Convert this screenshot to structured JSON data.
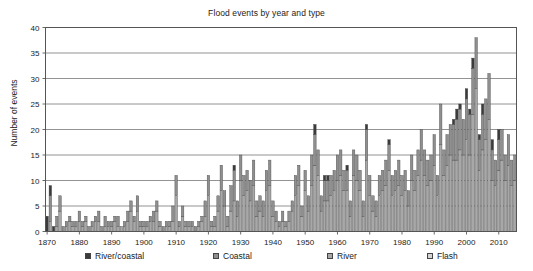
{
  "chart": {
    "title": "Flood events by year and type",
    "ylabel": "Number of events"
  },
  "legend": {
    "items": [
      {
        "label": "River/coastal",
        "color": "#3b3b3b",
        "x": 85
      },
      {
        "label": "Coastal",
        "color": "#8f8f8f",
        "x": 213
      },
      {
        "label": "River",
        "color": "#a8a8a8",
        "x": 327
      },
      {
        "label": "Flash",
        "color": "#d4d4d4",
        "x": 427
      }
    ]
  },
  "chart_data": {
    "type": "bar",
    "title": "Flood events by year and type",
    "xlabel": "",
    "ylabel": "Number of events",
    "ylim": [
      0,
      40
    ],
    "ytick_step": 5,
    "yticks": [
      0,
      5,
      10,
      15,
      20,
      25,
      30,
      35,
      40
    ],
    "xlim": [
      1870,
      2016
    ],
    "xticks": [
      1870,
      1880,
      1890,
      1900,
      1910,
      1920,
      1930,
      1940,
      1950,
      1960,
      1970,
      1980,
      1990,
      2000,
      2010
    ],
    "grid": true,
    "stacked": true,
    "legend_position": "bottom",
    "series": [
      {
        "name": "River/coastal",
        "color": "#3b3b3b"
      },
      {
        "name": "Coastal",
        "color": "#8f8f8f"
      },
      {
        "name": "River",
        "color": "#a8a8a8"
      },
      {
        "name": "Flash",
        "color": "#d4d4d4"
      }
    ],
    "categories": [
      1870,
      1871,
      1872,
      1873,
      1874,
      1875,
      1876,
      1877,
      1878,
      1879,
      1880,
      1881,
      1882,
      1883,
      1884,
      1885,
      1886,
      1887,
      1888,
      1889,
      1890,
      1891,
      1892,
      1893,
      1894,
      1895,
      1896,
      1897,
      1898,
      1899,
      1900,
      1901,
      1902,
      1903,
      1904,
      1905,
      1906,
      1907,
      1908,
      1909,
      1910,
      1911,
      1912,
      1913,
      1914,
      1915,
      1916,
      1917,
      1918,
      1919,
      1920,
      1921,
      1922,
      1923,
      1924,
      1925,
      1926,
      1927,
      1928,
      1929,
      1930,
      1931,
      1932,
      1933,
      1934,
      1935,
      1936,
      1937,
      1938,
      1939,
      1940,
      1941,
      1942,
      1943,
      1944,
      1945,
      1946,
      1947,
      1948,
      1949,
      1950,
      1951,
      1952,
      1953,
      1954,
      1955,
      1956,
      1957,
      1958,
      1959,
      1960,
      1961,
      1962,
      1963,
      1964,
      1965,
      1966,
      1967,
      1968,
      1969,
      1970,
      1971,
      1972,
      1973,
      1974,
      1975,
      1976,
      1977,
      1978,
      1979,
      1980,
      1981,
      1982,
      1983,
      1984,
      1985,
      1986,
      1987,
      1988,
      1989,
      1990,
      1991,
      1992,
      1993,
      1994,
      1995,
      1996,
      1997,
      1998,
      1999,
      2000,
      2001,
      2002,
      2003,
      2004,
      2005,
      2006,
      2007,
      2008,
      2009,
      2010,
      2011,
      2012,
      2013,
      2014,
      2015
    ],
    "stacks": [
      [
        3,
        0,
        0,
        0
      ],
      [
        2,
        5,
        2,
        0
      ],
      [
        1,
        0,
        0,
        0
      ],
      [
        0,
        2,
        1,
        0
      ],
      [
        0,
        3,
        4,
        0
      ],
      [
        0,
        1,
        0,
        0
      ],
      [
        0,
        1,
        1,
        0
      ],
      [
        0,
        1,
        2,
        0
      ],
      [
        0,
        1,
        1,
        0
      ],
      [
        0,
        1,
        1,
        0
      ],
      [
        0,
        2,
        2,
        0
      ],
      [
        0,
        1,
        1,
        0
      ],
      [
        0,
        1,
        2,
        0
      ],
      [
        0,
        1,
        0,
        0
      ],
      [
        0,
        1,
        1,
        0
      ],
      [
        0,
        1,
        2,
        0
      ],
      [
        0,
        2,
        2,
        0
      ],
      [
        0,
        1,
        0,
        0
      ],
      [
        0,
        2,
        1,
        0
      ],
      [
        0,
        1,
        1,
        0
      ],
      [
        0,
        1,
        1,
        0
      ],
      [
        0,
        1,
        2,
        0
      ],
      [
        0,
        2,
        1,
        0
      ],
      [
        0,
        0,
        1,
        0
      ],
      [
        0,
        1,
        1,
        0
      ],
      [
        0,
        2,
        2,
        0
      ],
      [
        0,
        2,
        4,
        0
      ],
      [
        0,
        1,
        2,
        0
      ],
      [
        0,
        3,
        4,
        0
      ],
      [
        0,
        1,
        1,
        0
      ],
      [
        0,
        1,
        1,
        0
      ],
      [
        0,
        1,
        1,
        0
      ],
      [
        0,
        1,
        2,
        0
      ],
      [
        0,
        2,
        2,
        0
      ],
      [
        0,
        2,
        4,
        0
      ],
      [
        0,
        1,
        1,
        0
      ],
      [
        0,
        1,
        0,
        0
      ],
      [
        0,
        1,
        1,
        0
      ],
      [
        0,
        1,
        1,
        0
      ],
      [
        0,
        3,
        2,
        0
      ],
      [
        0,
        4,
        7,
        0
      ],
      [
        0,
        1,
        1,
        0
      ],
      [
        0,
        2,
        3,
        0
      ],
      [
        0,
        1,
        1,
        0
      ],
      [
        0,
        1,
        1,
        0
      ],
      [
        0,
        1,
        1,
        0
      ],
      [
        0,
        1,
        0,
        0
      ],
      [
        0,
        1,
        1,
        0
      ],
      [
        0,
        1,
        2,
        0
      ],
      [
        0,
        3,
        3,
        0
      ],
      [
        0,
        4,
        7,
        0
      ],
      [
        0,
        1,
        1,
        0
      ],
      [
        0,
        2,
        1,
        0
      ],
      [
        0,
        3,
        4,
        0
      ],
      [
        0,
        5,
        8,
        0
      ],
      [
        0,
        3,
        5,
        0
      ],
      [
        0,
        2,
        1,
        0
      ],
      [
        0,
        5,
        4,
        0
      ],
      [
        1,
        6,
        6,
        0
      ],
      [
        0,
        3,
        3,
        0
      ],
      [
        0,
        5,
        10,
        0
      ],
      [
        0,
        4,
        7,
        0
      ],
      [
        0,
        4,
        8,
        0
      ],
      [
        0,
        4,
        6,
        0
      ],
      [
        0,
        5,
        9,
        0
      ],
      [
        0,
        3,
        3,
        0
      ],
      [
        0,
        3,
        4,
        0
      ],
      [
        0,
        3,
        3,
        0
      ],
      [
        0,
        4,
        8,
        0
      ],
      [
        0,
        5,
        9,
        0
      ],
      [
        0,
        3,
        3,
        0
      ],
      [
        0,
        2,
        2,
        0
      ],
      [
        0,
        1,
        1,
        0
      ],
      [
        0,
        2,
        2,
        0
      ],
      [
        0,
        1,
        1,
        0
      ],
      [
        0,
        2,
        2,
        0
      ],
      [
        0,
        2,
        4,
        0
      ],
      [
        0,
        4,
        7,
        0
      ],
      [
        0,
        4,
        9,
        0
      ],
      [
        0,
        2,
        3,
        0
      ],
      [
        0,
        4,
        8,
        0
      ],
      [
        0,
        3,
        4,
        0
      ],
      [
        0,
        6,
        9,
        0
      ],
      [
        2,
        6,
        13,
        0
      ],
      [
        0,
        5,
        11,
        0
      ],
      [
        0,
        3,
        4,
        0
      ],
      [
        1,
        4,
        6,
        0
      ],
      [
        1,
        4,
        6,
        0
      ],
      [
        0,
        4,
        7,
        0
      ],
      [
        0,
        4,
        8,
        0
      ],
      [
        0,
        5,
        10,
        0
      ],
      [
        0,
        5,
        11,
        0
      ],
      [
        0,
        4,
        8,
        0
      ],
      [
        1,
        4,
        8,
        0
      ],
      [
        0,
        3,
        3,
        0
      ],
      [
        0,
        5,
        11,
        0
      ],
      [
        0,
        5,
        10,
        0
      ],
      [
        0,
        4,
        8,
        0
      ],
      [
        0,
        3,
        3,
        0
      ],
      [
        1,
        6,
        14,
        0
      ],
      [
        0,
        4,
        7,
        0
      ],
      [
        0,
        3,
        4,
        0
      ],
      [
        0,
        3,
        3,
        0
      ],
      [
        0,
        4,
        7,
        0
      ],
      [
        0,
        4,
        8,
        0
      ],
      [
        0,
        5,
        9,
        0
      ],
      [
        1,
        5,
        12,
        0
      ],
      [
        0,
        4,
        7,
        0
      ],
      [
        0,
        4,
        8,
        0
      ],
      [
        0,
        5,
        9,
        0
      ],
      [
        0,
        4,
        7,
        0
      ],
      [
        0,
        4,
        8,
        0
      ],
      [
        0,
        3,
        5,
        0
      ],
      [
        0,
        5,
        10,
        0
      ],
      [
        0,
        4,
        8,
        0
      ],
      [
        0,
        5,
        11,
        0
      ],
      [
        0,
        6,
        14,
        0
      ],
      [
        0,
        5,
        11,
        0
      ],
      [
        0,
        5,
        9,
        0
      ],
      [
        0,
        5,
        10,
        0
      ],
      [
        0,
        6,
        13,
        0
      ],
      [
        0,
        4,
        7,
        0
      ],
      [
        0,
        8,
        17,
        0
      ],
      [
        0,
        5,
        11,
        0
      ],
      [
        0,
        6,
        13,
        0
      ],
      [
        0,
        6,
        15,
        0
      ],
      [
        1,
        7,
        14,
        0
      ],
      [
        2,
        8,
        14,
        0
      ],
      [
        1,
        8,
        16,
        0
      ],
      [
        0,
        7,
        15,
        0
      ],
      [
        2,
        8,
        18,
        0
      ],
      [
        1,
        8,
        15,
        0
      ],
      [
        2,
        9,
        23,
        0
      ],
      [
        0,
        10,
        28,
        0
      ],
      [
        1,
        6,
        12,
        0
      ],
      [
        2,
        7,
        16,
        0
      ],
      [
        0,
        8,
        18,
        0
      ],
      [
        0,
        9,
        22,
        0
      ],
      [
        2,
        6,
        10,
        0
      ],
      [
        0,
        5,
        9,
        0
      ],
      [
        2,
        6,
        12,
        0
      ],
      [
        0,
        6,
        14,
        0
      ],
      [
        0,
        5,
        10,
        0
      ],
      [
        0,
        6,
        13,
        0
      ],
      [
        0,
        5,
        9,
        0
      ],
      [
        0,
        5,
        10,
        0
      ]
    ]
  }
}
